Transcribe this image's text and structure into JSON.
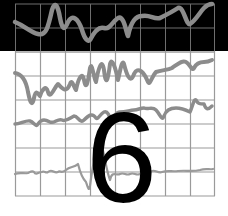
{
  "cover": {
    "numeral": "6",
    "colors": {
      "band": "#000000",
      "background": "#ffffff",
      "grid_on_black": "#6e6e6e",
      "grid_on_white": "#9a9a9a",
      "trace": "#8c8c8c",
      "numeral": "#000000"
    },
    "grid": {
      "left": 15,
      "right": 215,
      "top": 4,
      "bottom": 196,
      "cols": 8,
      "rows": 8
    },
    "traces": [
      {
        "name": "top-trace",
        "zone": "black-band"
      },
      {
        "name": "trace-2",
        "zone": "white"
      },
      {
        "name": "trace-3",
        "zone": "white"
      },
      {
        "name": "trace-4",
        "zone": "white"
      }
    ]
  }
}
